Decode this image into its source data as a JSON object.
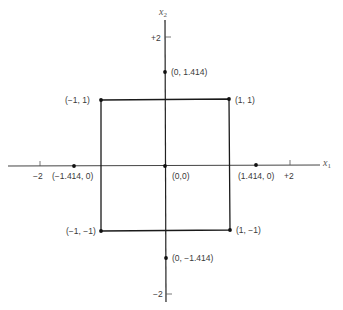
{
  "diagram": {
    "axes": {
      "x_label": "x",
      "x_label_sub": "1",
      "y_label": "x",
      "y_label_sub": "2",
      "ticks": {
        "x_neg": "−2",
        "x_pos": "+2",
        "y_pos": "+2",
        "y_neg": "−2"
      }
    },
    "points": [
      {
        "id": "p_0_1414",
        "label": "(0, 1.414)",
        "x": 0,
        "y": 1.414
      },
      {
        "id": "p_m1_1",
        "label": "(−1, 1)",
        "x": -1,
        "y": 1
      },
      {
        "id": "p_1_1",
        "label": "(1, 1)",
        "x": 1,
        "y": 1
      },
      {
        "id": "p_m1414_0",
        "label": "(−1.414, 0)",
        "x": -1.414,
        "y": 0
      },
      {
        "id": "p_0_0",
        "label": "(0,0)",
        "x": 0,
        "y": 0
      },
      {
        "id": "p_1414_0",
        "label": "(1.414, 0)",
        "x": 1.414,
        "y": 0
      },
      {
        "id": "p_m1_m1",
        "label": "(−1, −1)",
        "x": -1,
        "y": -1
      },
      {
        "id": "p_1_m1",
        "label": "(1, −1)",
        "x": 1,
        "y": -1
      },
      {
        "id": "p_0_m1414",
        "label": "(0, −1.414)",
        "x": 0,
        "y": -1.414
      }
    ],
    "square": {
      "corners": [
        "(−1, 1)",
        "(1, 1)",
        "(1, −1)",
        "(−1, −1)"
      ]
    },
    "colors": {
      "line": "#1a1a1a",
      "text": "#3a3a3a",
      "background": "#ffffff"
    }
  }
}
